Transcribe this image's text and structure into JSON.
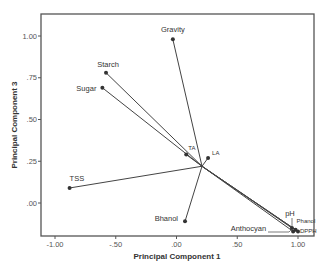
{
  "chart_data": {
    "type": "scatter",
    "subtype": "biplot-loadings",
    "title": "",
    "xlabel": "Principal Component 1",
    "ylabel": "Principal Component 3",
    "xlim": [
      -1.1,
      1.1
    ],
    "ylim": [
      -0.2,
      1.13
    ],
    "x_ticks": [
      "-1.00",
      "-.50",
      ".00",
      ".50",
      "1.00"
    ],
    "x_tick_values": [
      -1.0,
      -0.5,
      0.0,
      0.5,
      1.0
    ],
    "y_ticks": [
      ".00",
      ".25",
      ".50",
      ".75",
      "1.00"
    ],
    "y_tick_values": [
      0.0,
      0.25,
      0.5,
      0.75,
      1.0
    ],
    "grid": false,
    "legend": null,
    "origin": {
      "x": 0.21,
      "y": 0.22
    },
    "points": [
      {
        "label": "Gravity",
        "x": -0.03,
        "y": 0.98
      },
      {
        "label": "Starch",
        "x": -0.58,
        "y": 0.78
      },
      {
        "label": "Sugar",
        "x": -0.61,
        "y": 0.69
      },
      {
        "label": "TSS",
        "x": -0.88,
        "y": 0.09
      },
      {
        "label": "TA",
        "x": 0.08,
        "y": 0.29
      },
      {
        "label": "LA",
        "x": 0.26,
        "y": 0.27
      },
      {
        "label": "Bhanol",
        "x": 0.07,
        "y": -0.11
      },
      {
        "label": "pH",
        "x": 0.95,
        "y": -0.15
      },
      {
        "label": "Phanol",
        "x": 0.98,
        "y": -0.16
      },
      {
        "label": "DPPH",
        "x": 1.0,
        "y": -0.17
      },
      {
        "label": "Anthocyan",
        "x": 0.96,
        "y": -0.17
      }
    ]
  },
  "colors": {
    "line": "#444444",
    "frame": "#555555",
    "point": "#333333"
  }
}
